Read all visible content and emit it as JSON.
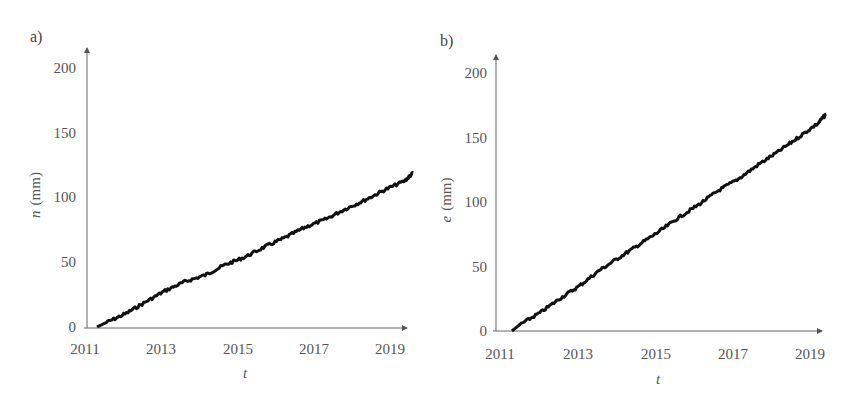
{
  "figure": {
    "panels": [
      {
        "label": "a)",
        "ylabel": "n (mm)",
        "ylabel_var": "n",
        "ylabel_unit": "(mm)",
        "xlabel": "t"
      },
      {
        "label": "b)",
        "ylabel": "e (mm)",
        "ylabel_var": "e",
        "ylabel_unit": "(mm)",
        "xlabel": "t"
      }
    ],
    "line_color": "#111111",
    "axis_color": "#555555"
  },
  "chart_data": [
    {
      "type": "line",
      "title": "a)",
      "xlabel": "t",
      "ylabel": "n (mm)",
      "xlim": [
        2011,
        2019.2
      ],
      "ylim": [
        0,
        200
      ],
      "xticks": [
        "2011",
        "2013",
        "2015",
        "2017",
        "2019"
      ],
      "yticks": [
        "0",
        "50",
        "100",
        "150",
        "200"
      ],
      "grid": false,
      "legend": null,
      "series": [
        {
          "name": "n",
          "x": [
            2011.3,
            2011.5,
            2012.0,
            2012.5,
            2013.0,
            2013.5,
            2014.0,
            2014.5,
            2015.0,
            2015.5,
            2016.0,
            2016.5,
            2017.0,
            2017.5,
            2018.0,
            2018.5,
            2019.0,
            2019.2
          ],
          "y": [
            0,
            3,
            10,
            19,
            28,
            35,
            40,
            48,
            54,
            62,
            69,
            77,
            83,
            91,
            98,
            106,
            113,
            119
          ]
        }
      ]
    },
    {
      "type": "line",
      "title": "b)",
      "xlabel": "t",
      "ylabel": "e (mm)",
      "xlim": [
        2011,
        2019.2
      ],
      "ylim": [
        0,
        200
      ],
      "xticks": [
        "2011",
        "2013",
        "2015",
        "2017",
        "2019"
      ],
      "yticks": [
        "0",
        "50",
        "100",
        "150",
        "200"
      ],
      "grid": false,
      "legend": null,
      "series": [
        {
          "name": "e",
          "x": [
            2011.3,
            2011.5,
            2012.0,
            2012.5,
            2013.0,
            2013.5,
            2014.0,
            2014.5,
            2015.0,
            2015.5,
            2016.0,
            2016.5,
            2017.0,
            2017.5,
            2018.0,
            2018.5,
            2019.0,
            2019.2
          ],
          "y": [
            0,
            5,
            14,
            25,
            35,
            47,
            57,
            67,
            77,
            88,
            98,
            109,
            118,
            129,
            139,
            150,
            161,
            168
          ]
        }
      ]
    }
  ]
}
